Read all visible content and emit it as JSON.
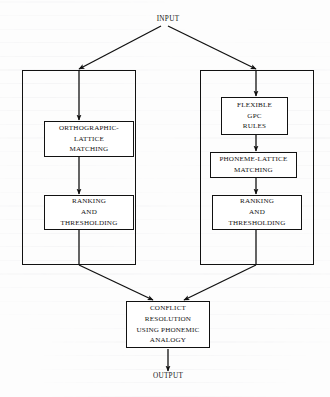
{
  "diagram": {
    "ink_color": "#111111",
    "background_color": "#fdfdfd",
    "endpoints": {
      "input": "INPUT",
      "output": "OUTPUT"
    },
    "panels": [
      {
        "id": "orthographic-route",
        "label": ""
      },
      {
        "id": "phonemic-route",
        "label": ""
      }
    ],
    "nodes": {
      "orthographic_lattice_matching": {
        "lines": [
          "ORTHOGRAPHIC-",
          "LATTICE",
          "MATCHING"
        ]
      },
      "left_ranking_thresholding": {
        "lines": [
          "RANKING",
          "AND",
          "THRESHOLDING"
        ]
      },
      "flexible_gpc_rules": {
        "lines": [
          "FLEXIBLE",
          "GPC",
          "RULES"
        ]
      },
      "phoneme_lattice_matching": {
        "lines": [
          "PHONEME-LATTICE",
          "MATCHING"
        ]
      },
      "right_ranking_thresholding": {
        "lines": [
          "RANKING",
          "AND",
          "THRESHOLDING"
        ]
      },
      "conflict_resolution": {
        "lines": [
          "CONFLICT",
          "RESOLUTION",
          "USING PHONEMIC",
          "ANALOGY"
        ]
      }
    }
  }
}
